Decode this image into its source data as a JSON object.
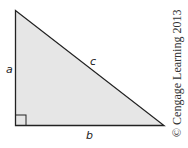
{
  "diagram": {
    "type": "right-triangle",
    "fill_color": "#e6e6e6",
    "stroke_color": "#222222",
    "labels": {
      "vertical_leg": "a",
      "horizontal_leg": "b",
      "hypotenuse": "c"
    },
    "right_angle_marker": true
  },
  "copyright": "© Cengage Learning 2013"
}
